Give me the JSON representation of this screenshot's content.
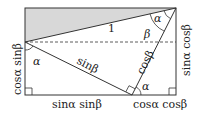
{
  "diagram": {
    "shade_color": "#d8d8d8",
    "line_color": "#333333",
    "labels": {
      "hypotenuse": "1",
      "alpha_top": "α",
      "beta_top": "β",
      "alpha_left": "α",
      "alpha_bottom": "α",
      "sin_beta": "sinβ",
      "cos_beta": "cosβ",
      "left_side": "cosα sinβ",
      "right_side": "sinα cosβ",
      "bottom_left": "sinα sinβ",
      "bottom_right": "cosα cosβ"
    }
  }
}
